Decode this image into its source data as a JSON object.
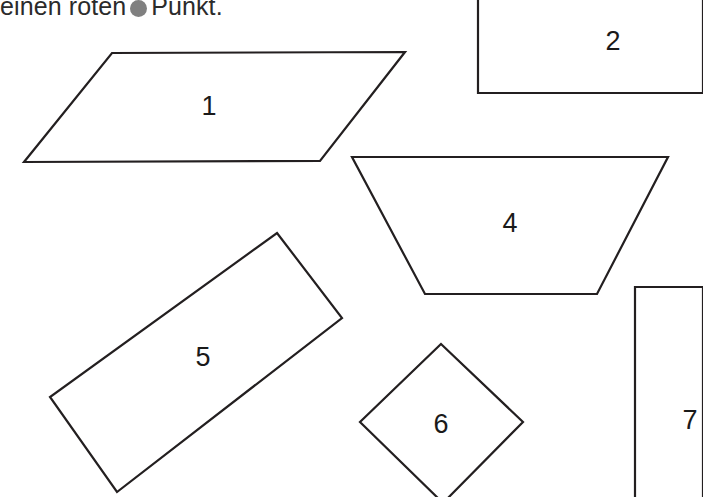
{
  "page": {
    "width": 703,
    "height": 497,
    "background_color": "#ffffff",
    "stroke_color": "#231f20",
    "text_color": "#2b2b2b"
  },
  "instruction": {
    "text_before": "einen roten",
    "marker_icon": "filled-circle-icon",
    "marker_color": "#808080",
    "text_after": "Punkt.",
    "full_text": "einen roten ● Punkt."
  },
  "shapes": [
    {
      "label": "1",
      "kind": "parallelogram",
      "points": "112,53 405,52 320,161 24,162",
      "label_x": 209,
      "label_y": 106,
      "clipped": false
    },
    {
      "label": "2",
      "kind": "rectangle-clipped",
      "points": "703,-6 478,-6 478,93 703,93",
      "label_x": 613,
      "label_y": 41,
      "clipped": true
    },
    {
      "label": "4",
      "kind": "trapezoid",
      "points": "352,157 668,157 597,294 425,294",
      "label_x": 510,
      "label_y": 223,
      "clipped": false
    },
    {
      "label": "5",
      "kind": "rotated-rectangle",
      "points": "277,233 342,318 117,492 50,397",
      "label_x": 203,
      "label_y": 357,
      "clipped": false
    },
    {
      "label": "6",
      "kind": "diamond",
      "points": "441,344 523,422 443,503 360,422",
      "label_x": 441,
      "label_y": 424,
      "clipped": true
    },
    {
      "label": "7",
      "kind": "rectangle-clipped",
      "points": "703,287 635,287 635,503 703,503",
      "label_x": 690,
      "label_y": 420,
      "clipped": true
    }
  ]
}
